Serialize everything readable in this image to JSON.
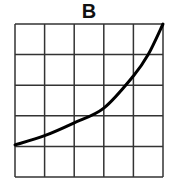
{
  "title": "B",
  "chart_data": {
    "type": "line",
    "title": "B",
    "xlabel": "",
    "ylabel": "",
    "grid": true,
    "grid_cells": [
      5,
      5
    ],
    "xlim": [
      0,
      5
    ],
    "ylim": [
      0,
      5
    ],
    "series": [
      {
        "name": "curve",
        "shape": "exponential increasing",
        "x": [
          0,
          1,
          2,
          3,
          4,
          4.5,
          5
        ],
        "y": [
          1.05,
          1.35,
          1.77,
          2.25,
          3.3,
          4.0,
          5.0
        ]
      }
    ],
    "colors": {
      "grid": "#333333",
      "curve": "#000000"
    }
  }
}
